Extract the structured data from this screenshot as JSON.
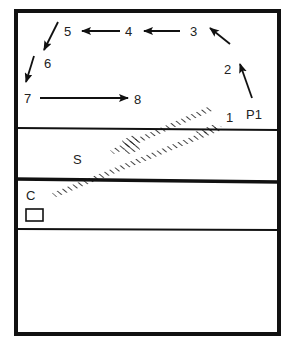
{
  "diagram": {
    "colors": {
      "line": "#111111",
      "text": "#222222",
      "background": "#ffffff"
    },
    "labels": {
      "n1": "1",
      "n2": "2",
      "n3": "3",
      "n4": "4",
      "n5": "5",
      "n6": "6",
      "n7": "7",
      "n8": "8",
      "p1": "P1",
      "s": "S",
      "c": "C"
    },
    "path_sequence": [
      "P1",
      "2",
      "3",
      "4",
      "5",
      "6",
      "7",
      "8"
    ]
  }
}
